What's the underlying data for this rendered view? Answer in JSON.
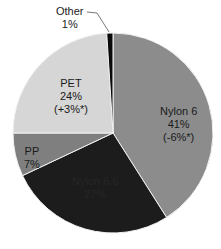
{
  "chart_data": {
    "type": "pie",
    "title": "",
    "start_angle_deg": 0,
    "direction": "clockwise",
    "slices": [
      {
        "name": "Nylon 6",
        "value": 41,
        "label": "41%",
        "change": "(-6%*)",
        "color": "#8c8c8c"
      },
      {
        "name": "Nylon 6,6",
        "value": 27,
        "label": "27%",
        "change": "",
        "color": "#1c1c1c"
      },
      {
        "name": "PP",
        "value": 7,
        "label": "7%",
        "change": "",
        "color": "#7f7f7f"
      },
      {
        "name": "PET",
        "value": 24,
        "label": "24%",
        "change": "(+3%*)",
        "color": "#d6d6d6"
      },
      {
        "name": "Other",
        "value": 1,
        "label": "1%",
        "change": "",
        "color": "#0a0a0a"
      }
    ],
    "legend": "none",
    "annotations": [
      "Other 1% (leader line)"
    ]
  },
  "labels": {
    "nylon6": {
      "name": "Nylon 6",
      "pct": "41%",
      "change": "(-6%*)"
    },
    "nylon66": {
      "name": "Nylon 6,6",
      "pct": "27%"
    },
    "pp": {
      "name": "PP",
      "pct": "7%"
    },
    "pet": {
      "name": "PET",
      "pct": "24%",
      "change": "(+3%*)"
    },
    "other": {
      "name": "Other",
      "pct": "1%"
    }
  }
}
